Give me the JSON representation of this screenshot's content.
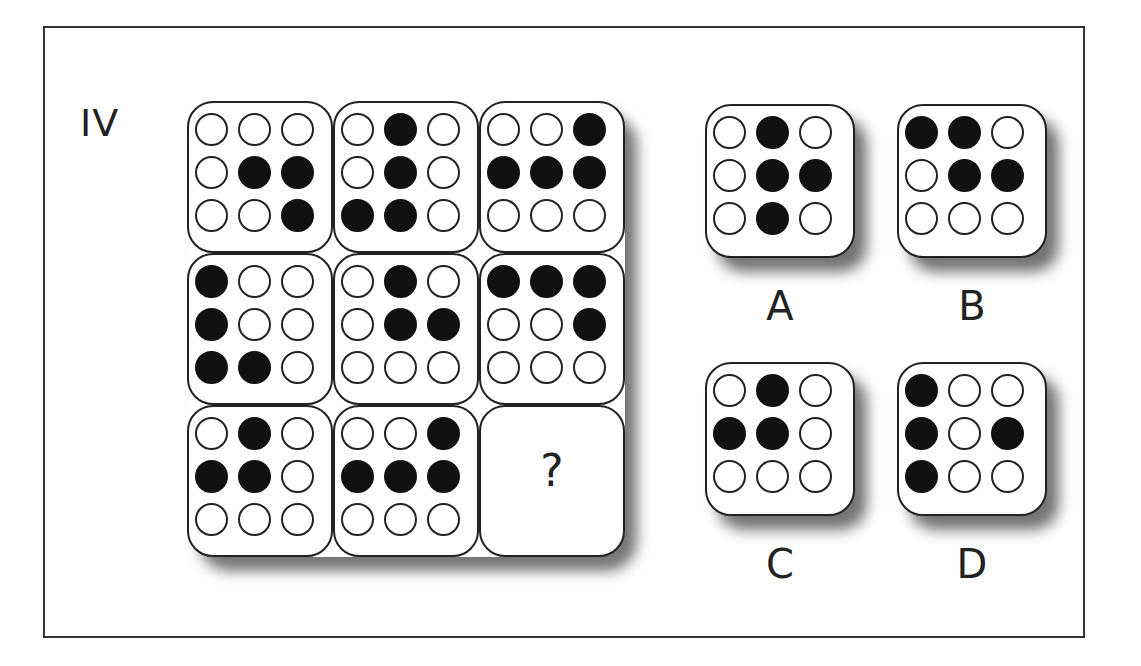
{
  "puzzle": {
    "set_label": "IV",
    "question_mark": "?",
    "colors": {
      "frame": "#333333",
      "filled_dot": "#111111",
      "empty_dot": "#ffffff",
      "tile_border": "#222222"
    },
    "matrix": [
      [
        [
          0,
          0,
          0
        ],
        [
          0,
          1,
          1
        ],
        [
          0,
          0,
          1
        ]
      ],
      [
        [
          0,
          1,
          0
        ],
        [
          0,
          1,
          0
        ],
        [
          1,
          1,
          0
        ]
      ],
      [
        [
          0,
          0,
          1
        ],
        [
          1,
          1,
          1
        ],
        [
          0,
          0,
          0
        ]
      ],
      [
        [
          1,
          0,
          0
        ],
        [
          1,
          0,
          0
        ],
        [
          1,
          1,
          0
        ]
      ],
      [
        [
          0,
          1,
          0
        ],
        [
          0,
          1,
          1
        ],
        [
          0,
          0,
          0
        ]
      ],
      [
        [
          1,
          1,
          1
        ],
        [
          0,
          0,
          1
        ],
        [
          0,
          0,
          0
        ]
      ],
      [
        [
          0,
          1,
          0
        ],
        [
          1,
          1,
          0
        ],
        [
          0,
          0,
          0
        ]
      ],
      [
        [
          0,
          0,
          1
        ],
        [
          1,
          1,
          1
        ],
        [
          0,
          0,
          0
        ]
      ],
      null
    ],
    "options": [
      {
        "label": "A",
        "pattern": [
          [
            0,
            1,
            0
          ],
          [
            0,
            1,
            1
          ],
          [
            0,
            1,
            0
          ]
        ]
      },
      {
        "label": "B",
        "pattern": [
          [
            1,
            1,
            0
          ],
          [
            0,
            1,
            1
          ],
          [
            0,
            0,
            0
          ]
        ]
      },
      {
        "label": "C",
        "pattern": [
          [
            0,
            1,
            0
          ],
          [
            1,
            1,
            0
          ],
          [
            0,
            0,
            0
          ]
        ]
      },
      {
        "label": "D",
        "pattern": [
          [
            1,
            0,
            0
          ],
          [
            1,
            0,
            1
          ],
          [
            1,
            0,
            0
          ]
        ]
      }
    ]
  }
}
